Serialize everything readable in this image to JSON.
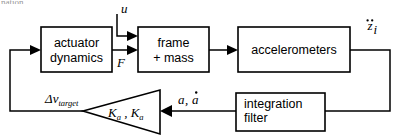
{
  "diagram": {
    "title_fragment": "nation",
    "type": "control-system-block-diagram",
    "blocks": [
      {
        "id": "actuator",
        "label_line1": "actuator",
        "label_line2": "dynamics"
      },
      {
        "id": "frame",
        "label_line1": "frame",
        "label_line2": "+ mass"
      },
      {
        "id": "accelerometers",
        "label_line1": "accelerometers",
        "label_line2": ""
      },
      {
        "id": "integration",
        "label_line1": "integration",
        "label_line2": "filter"
      }
    ],
    "gain_block": {
      "id": "gain-triangle",
      "label_k1": "K",
      "label_k1_sub": "a",
      "separator": ",",
      "label_k2": "K",
      "label_k2_sub": "a"
    },
    "signals": {
      "input_u": "u",
      "force_F": "F",
      "accel_z": "z",
      "accel_z_sub": "i",
      "alpha": "a",
      "alpha_comma": ",",
      "alpha_dot": "a",
      "delta_v": "v",
      "delta_v_prefix": "Δ",
      "delta_v_sub": "target"
    },
    "colors": {
      "background": "#ffffff",
      "stroke": "#000000",
      "text": "#000000"
    }
  }
}
